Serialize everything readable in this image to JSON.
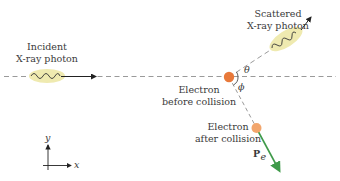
{
  "diagram": {
    "incident_photon": {
      "line1": "Incident",
      "line2": "X-ray photon"
    },
    "scattered_photon": {
      "line1": "Scattered",
      "line2": "X-ray photon"
    },
    "electron_before": {
      "line1": "Electron",
      "line2": "before collision"
    },
    "electron_after": {
      "line1": "Electron",
      "line2": "after collision"
    },
    "angle_theta": "θ",
    "angle_phi": "ϕ",
    "momentum_label": "P",
    "momentum_subscript": "e",
    "axes": {
      "x": "x",
      "y": "y"
    },
    "colors": {
      "photon_ellipse": "#efeab0",
      "electron_before": "#e8793a",
      "electron_after": "#f2a66d",
      "momentum_arrow": "#3f9a4a",
      "dashed_line": "#9a9a9a",
      "text": "#3a3a3a"
    }
  }
}
